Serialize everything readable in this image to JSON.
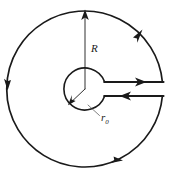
{
  "figure": {
    "background_color": "#ffffff",
    "stroke_color": "#1a1a1a",
    "leader_color": "#4a4a4a",
    "width": 174,
    "height": 179,
    "labels": {
      "outer_radius": "R",
      "inner_radius_base": "r",
      "inner_radius_subscript": "0"
    },
    "geometry": {
      "center_x": 85,
      "center_y": 89,
      "outer_radius_px": 78,
      "inner_radius_px": 21,
      "lead_top_y": 82,
      "lead_bottom_y": 96,
      "lead_right_x": 172
    },
    "arrows": [
      {
        "name": "outer-top-right-arrow",
        "direction": "counterclockwise-up"
      },
      {
        "name": "outer-left-arrow",
        "direction": "down"
      },
      {
        "name": "outer-bottom-arrow",
        "direction": "right"
      },
      {
        "name": "radius-up-arrow",
        "direction": "up"
      },
      {
        "name": "inner-radius-arrow",
        "direction": "down-left"
      },
      {
        "name": "lead-top-arrow",
        "direction": "right"
      },
      {
        "name": "lead-bottom-arrow",
        "direction": "left"
      }
    ]
  }
}
